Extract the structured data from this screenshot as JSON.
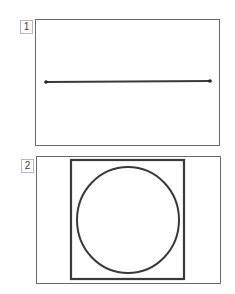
{
  "panels": [
    {
      "label": "1",
      "figure": "horizontal line segment with endpoints",
      "line": {
        "x1": 46,
        "y1": 82,
        "x2": 210,
        "y2": 81
      }
    },
    {
      "label": "2",
      "figure": "circle inscribed in square",
      "square": {
        "x": 70,
        "y": 160,
        "w": 114,
        "h": 119
      },
      "circle": {
        "cx": 128,
        "cy": 220,
        "rx": 51,
        "ry": 53
      }
    }
  ],
  "colors": {
    "stroke": "#3a3a3a",
    "frame": "#6a6a6a",
    "label_border": "#b8b8b8"
  }
}
